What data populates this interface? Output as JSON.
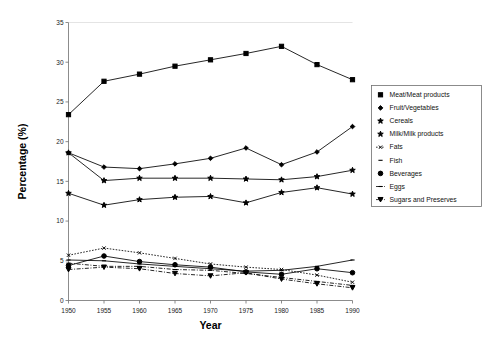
{
  "chart_data": {
    "type": "line",
    "title": "",
    "xlabel": "Year",
    "ylabel": "Percentage (%)",
    "x": [
      1950,
      1955,
      1960,
      1965,
      1970,
      1975,
      1980,
      1985,
      1990
    ],
    "xticklabels": [
      "1950",
      "1955",
      "1960",
      "1965",
      "1970",
      "1975",
      "1980",
      "1985",
      "1990"
    ],
    "yticklabels": [
      "0",
      "5",
      "10",
      "15",
      "20",
      "25",
      "30",
      "35"
    ],
    "xlim": [
      1950,
      1990
    ],
    "ylim": [
      0,
      35
    ],
    "ytick_step": 5,
    "grid": false,
    "legend_position": "right-outside",
    "series": [
      {
        "name": "Meat/Meat products",
        "marker": "square",
        "linestyle": "solid",
        "values": [
          23.4,
          27.6,
          28.5,
          29.5,
          30.3,
          31.1,
          32.0,
          29.7,
          27.8
        ]
      },
      {
        "name": "Fruit/Vegetables",
        "marker": "diamond",
        "linestyle": "solid",
        "values": [
          18.6,
          16.8,
          16.6,
          17.2,
          17.9,
          19.2,
          17.1,
          18.7,
          21.9
        ]
      },
      {
        "name": "Cereals",
        "marker": "star",
        "linestyle": "solid",
        "values": [
          18.6,
          15.1,
          15.4,
          15.4,
          15.4,
          15.3,
          15.2,
          15.6,
          16.4
        ]
      },
      {
        "name": "Milk/Milk products",
        "marker": "star",
        "linestyle": "solid",
        "values": [
          13.5,
          12.0,
          12.7,
          13.0,
          13.1,
          12.3,
          13.6,
          14.2,
          13.4
        ]
      },
      {
        "name": "Fats",
        "marker": "x-small",
        "linestyle": "dotted",
        "values": [
          5.7,
          6.6,
          6.0,
          5.3,
          4.6,
          4.2,
          3.9,
          3.2,
          2.3
        ]
      },
      {
        "name": "Fish",
        "marker": "dash-small",
        "linestyle": "solid",
        "values": [
          5.1,
          5.0,
          4.6,
          4.3,
          4.0,
          3.7,
          3.8,
          4.3,
          5.1
        ]
      },
      {
        "name": "Beverages",
        "marker": "circle",
        "linestyle": "solid",
        "values": [
          4.4,
          5.6,
          4.9,
          4.5,
          4.2,
          3.6,
          3.3,
          4.0,
          3.5
        ]
      },
      {
        "name": "Eggs",
        "marker": "dash",
        "linestyle": "dashdot",
        "values": [
          4.7,
          4.3,
          4.3,
          3.9,
          3.8,
          3.4,
          2.9,
          2.4,
          1.9
        ]
      },
      {
        "name": "Sugars and Preserves",
        "marker": "triangle-down",
        "linestyle": "dashdot",
        "values": [
          3.9,
          4.2,
          4.0,
          3.4,
          3.1,
          3.5,
          2.7,
          2.1,
          1.6
        ]
      }
    ]
  }
}
